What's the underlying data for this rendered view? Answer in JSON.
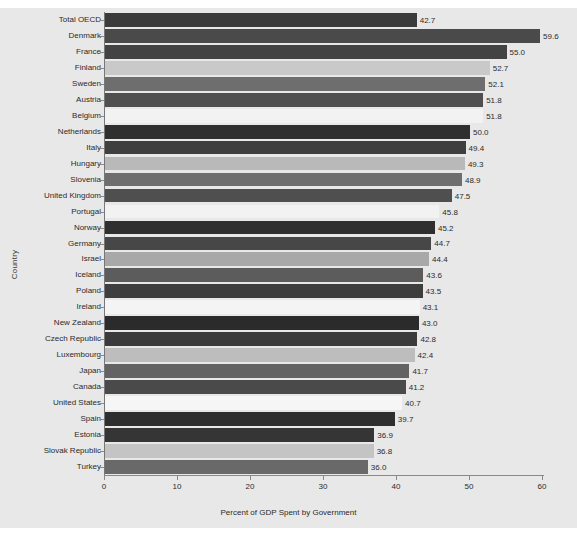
{
  "chart_data": {
    "type": "bar",
    "orientation": "horizontal",
    "title": "",
    "xlabel": "Percent of GDP Spent by Government",
    "ylabel": "Country",
    "xlim": [
      0,
      60
    ],
    "xticks": [
      0,
      10,
      20,
      30,
      40,
      50,
      60
    ],
    "grid": false,
    "legend": "none",
    "categories": [
      "Total OECD",
      "Denmark",
      "France",
      "Finland",
      "Sweden",
      "Austria",
      "Belgium",
      "Netherlands",
      "Italy",
      "Hungary",
      "Slovenia",
      "United Kingdom",
      "Portugal",
      "Norway",
      "Germany",
      "Israel",
      "Iceland",
      "Poland",
      "Ireland",
      "New Zealand",
      "Czech Republic",
      "Luxembourg",
      "Japan",
      "Canada",
      "United States",
      "Spain",
      "Estonia",
      "Slovak Republic",
      "Turkey"
    ],
    "values": [
      42.7,
      59.6,
      55.0,
      52.7,
      52.1,
      51.8,
      51.8,
      50.0,
      49.4,
      49.3,
      48.9,
      47.5,
      45.8,
      45.2,
      44.7,
      44.4,
      43.6,
      43.5,
      43.1,
      43.0,
      42.8,
      42.4,
      41.7,
      41.2,
      40.7,
      39.7,
      36.9,
      36.8,
      36.0
    ],
    "value_labels": [
      "42.7",
      "59.6",
      "55.0",
      "52.7",
      "52.1",
      "51.8",
      "51.8",
      "50.0",
      "49.4",
      "49.3",
      "48.9",
      "47.5",
      "45.8",
      "45.2",
      "44.7",
      "44.4",
      "43.6",
      "43.5",
      "43.1",
      "43.0",
      "42.8",
      "42.4",
      "41.7",
      "41.2",
      "40.7",
      "39.7",
      "36.9",
      "36.8",
      "36.0"
    ],
    "bar_colors": [
      "#3b3b3b",
      "#4a4a4a",
      "#434343",
      "#c9c9c9",
      "#6e6e6e",
      "#4f4f4f",
      "#f2f2f2",
      "#2f2f2f",
      "#3f3f3f",
      "#b9b9b9",
      "#6e6e6e",
      "#4f4f4f",
      "#f2f2f2",
      "#2f2f2f",
      "#474747",
      "#a8a8a8",
      "#5c5c5c",
      "#3e3e3e",
      "#f4f4f4",
      "#2b2b2b",
      "#3a3a3a",
      "#bdbdbd",
      "#636363",
      "#4a4a4a",
      "#f6f6f6",
      "#2e2e2e",
      "#353535",
      "#c4c4c4",
      "#696969"
    ],
    "background_color": "#e8e8e8",
    "axis_color": "#8a8a8a",
    "text_color": "#2b2b2b"
  },
  "axis": {
    "x_tick_labels": [
      "0",
      "10",
      "20",
      "30",
      "40",
      "50",
      "60"
    ]
  }
}
